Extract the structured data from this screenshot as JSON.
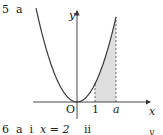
{
  "question5": {
    "number": "5",
    "part": "a"
  },
  "question6": {
    "number": "6",
    "part": "a",
    "subpart": "i",
    "answer": "x = 2",
    "next_subpart": "ii",
    "next_graph_axis": "y"
  },
  "chart_data": {
    "type": "line",
    "title": "",
    "function": "y = x^2",
    "xlabel": "x",
    "ylabel": "y",
    "origin_label": "O",
    "x_tick_labels": [
      "1",
      "a"
    ],
    "shaded_region": {
      "from": "1",
      "to": "a",
      "under": "curve"
    },
    "dashed_lines": [
      "x = 1",
      "x = a"
    ],
    "grid": false
  },
  "colors": {
    "curve": "#3a3a3a",
    "shade": "#d9d9d9",
    "axis": "#333333"
  }
}
